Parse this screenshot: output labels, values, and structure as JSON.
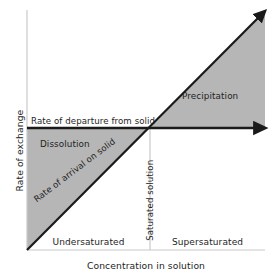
{
  "figure": {
    "type": "schematic-diagram",
    "topic": "Solubility: rate of exchange vs concentration in solution",
    "background_color": "#ffffff",
    "shaded_region_color": "#b6b6b6",
    "line_color": "#1a1a1a",
    "axis_color": "#c9c9c9",
    "text_color": "#1e1e1e"
  },
  "axes": {
    "y_title": "Rate of exchange",
    "x_title": "Concentration in solution",
    "origin": {
      "x": 27,
      "y": 250
    },
    "y_axis_top": {
      "x": 27,
      "y": 10
    },
    "x_axis_right": {
      "x": 265,
      "y": 250
    }
  },
  "lines": [
    {
      "name": "rate-of-departure-from-solid",
      "label": "Rate of departure from solid",
      "kind": "horizontal-arrow",
      "from": {
        "x": 27,
        "y": 128
      },
      "to": {
        "x": 264,
        "y": 128
      },
      "meaning": "constant rate, independent of concentration"
    },
    {
      "name": "rate-of-arrival-on-solid",
      "label": "Rate of arrival on solid",
      "kind": "diagonal-arrow",
      "from": {
        "x": 27,
        "y": 250
      },
      "to": {
        "x": 263,
        "y": 13
      },
      "meaning": "increases linearly with concentration"
    }
  ],
  "divider": {
    "name": "saturated-solution-line",
    "label": "Saturated solution",
    "x": 150,
    "from_y": 128,
    "to_y": 250,
    "meaning": "intersection point where the two rates are equal"
  },
  "regions": [
    {
      "name": "dissolution",
      "label": "Dissolution",
      "shaded": true,
      "description": "below the horizontal line and above the diagonal, left of saturation"
    },
    {
      "name": "precipitation",
      "label": "Precipitation",
      "shaded": true,
      "description": "above the horizontal line and below the diagonal, right of saturation"
    }
  ],
  "zone_labels": {
    "left": "Undersaturated",
    "right": "Supersaturated"
  }
}
